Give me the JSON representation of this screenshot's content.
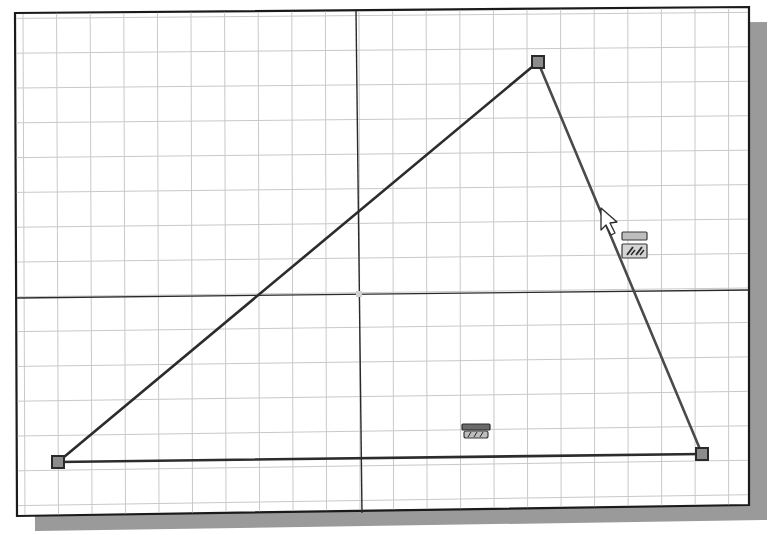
{
  "sketch": {
    "type": "2d-sketch-triangle",
    "colors": {
      "background": "#ffffff",
      "grid": "#c9c9c9",
      "geometry": "#2c2c2c",
      "vertex_fill": "#8c8c8c",
      "shadow": "#9a9a9a"
    },
    "frame": {
      "corners": [
        [
          15,
          13
        ],
        [
          749,
          7
        ],
        [
          749,
          505
        ],
        [
          17,
          516
        ]
      ],
      "shadow_offset": [
        18,
        15
      ]
    },
    "grid": {
      "spacing_x_px": 33.6,
      "spacing_y_px": 34.8
    },
    "axes": {
      "x_axis": [
        [
          17,
          298
        ],
        [
          749,
          290
        ]
      ],
      "y_axis": [
        [
          356,
          11
        ],
        [
          362,
          513
        ]
      ],
      "origin": [
        359,
        294
      ]
    },
    "triangle": {
      "vertices": [
        {
          "name": "bottom-left",
          "x": 58,
          "y": 462
        },
        {
          "name": "top",
          "x": 538,
          "y": 62
        },
        {
          "name": "bottom-right",
          "x": 702,
          "y": 454
        }
      ],
      "edges": [
        {
          "name": "left-edge",
          "from": 0,
          "to": 1
        },
        {
          "name": "right-edge",
          "from": 1,
          "to": 2
        },
        {
          "name": "bottom-edge",
          "from": 2,
          "to": 0
        }
      ]
    },
    "constraints": [
      {
        "name": "horizontal-constraint-icon",
        "kind": "horizontal",
        "x": 462,
        "y": 424
      },
      {
        "name": "parallel-constraint-icon",
        "kind": "parallel",
        "x": 622,
        "y": 232
      }
    ],
    "cursor": {
      "x": 601,
      "y": 208,
      "icon": "arrow-pointer"
    }
  }
}
